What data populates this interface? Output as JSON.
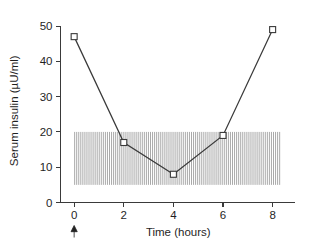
{
  "chart_data": {
    "type": "line",
    "title": "",
    "xlabel": "Time (hours)",
    "ylabel": "Serum insulin (µU/ml)",
    "x": [
      0,
      2,
      4,
      6,
      8
    ],
    "values": [
      47,
      17,
      8,
      19,
      49
    ],
    "series": [
      {
        "name": "Serum insulin",
        "marker": "open-square",
        "values": [
          47,
          17,
          8,
          19,
          49
        ]
      }
    ],
    "xlim": [
      -0.55,
      8.7
    ],
    "ylim": [
      0,
      52
    ],
    "xticks": [
      0,
      2,
      4,
      6,
      8
    ],
    "xticklabels": [
      "0",
      "2",
      "4",
      "6",
      "8"
    ],
    "yticks": [
      0,
      10,
      20,
      30,
      40,
      50
    ],
    "yticklabels": [
      "0",
      "10",
      "20",
      "30",
      "40",
      "50"
    ],
    "grid": false,
    "legend": null,
    "shaded_band": {
      "label": "reference range",
      "y_from": 5,
      "y_to": 20,
      "x_from": 0,
      "x_to": 8.35,
      "pattern": "vertical-hatch"
    },
    "annotations": [
      {
        "name": "dose-arrow",
        "symbol": "↑",
        "x": 0,
        "y": 0,
        "position": "below-x-axis"
      }
    ],
    "colors": {
      "line": "#3a3a3a",
      "marker_fill": "#ffffff",
      "marker_edge": "#3a3a3a",
      "axis": "#3a3a3a",
      "band_stripe": "#9a9a9a",
      "text": "#1f1f1f",
      "background": "#ffffff"
    }
  }
}
